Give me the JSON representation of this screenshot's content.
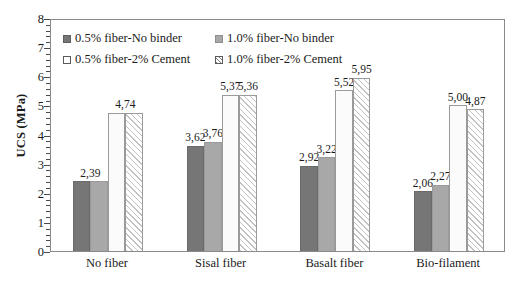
{
  "chart_data": {
    "type": "bar",
    "title": "",
    "xlabel": "",
    "ylabel": "UCS (MPa)",
    "ylim": [
      0,
      8
    ],
    "ytick_labels": [
      "0",
      "1",
      "2",
      "3",
      "4",
      "5",
      "6",
      "7",
      "8"
    ],
    "grid": false,
    "legend_position": "top-left-inside",
    "categories": [
      "No fiber",
      "Sisal fiber",
      "Basalt fiber",
      "Bio-filament"
    ],
    "series": [
      {
        "name": "0.5% fiber-No binder",
        "swatch": "solid-dark-gray",
        "color": "#767676",
        "values": [
          2.39,
          3.62,
          2.92,
          2.06
        ],
        "labels": [
          "2,39",
          "3,62",
          "2,92",
          "2,06"
        ]
      },
      {
        "name": "1.0% fiber-No binder",
        "swatch": "solid-light-gray",
        "color": "#a8a8a8",
        "values": [
          2.39,
          3.76,
          3.22,
          2.27
        ],
        "labels": [
          "",
          "3,76",
          "3,22",
          "2,27"
        ]
      },
      {
        "name": "0.5% fiber-2% Cement",
        "swatch": "dotted-white",
        "color": "#fbfbfb",
        "values": [
          4.74,
          5.37,
          5.52,
          5.0
        ],
        "labels": [
          "4,74",
          "5,37",
          "5,52",
          "5,00"
        ]
      },
      {
        "name": "1.0% fiber-2% Cement",
        "swatch": "hatched-white",
        "color": "#fdfdfd",
        "values": [
          4.74,
          5.36,
          5.95,
          4.87
        ],
        "labels": [
          "",
          "5,36",
          "5,95",
          "4,87"
        ]
      }
    ]
  },
  "legend": {
    "items": [
      {
        "label": "0.5% fiber-No binder",
        "swatch": "s1"
      },
      {
        "label": "1.0% fiber-No binder",
        "swatch": "s2"
      },
      {
        "label": "0.5% fiber-2% Cement",
        "swatch": "s3"
      },
      {
        "label": "1.0% fiber-2% Cement",
        "swatch": "s4"
      }
    ]
  },
  "caption": ""
}
